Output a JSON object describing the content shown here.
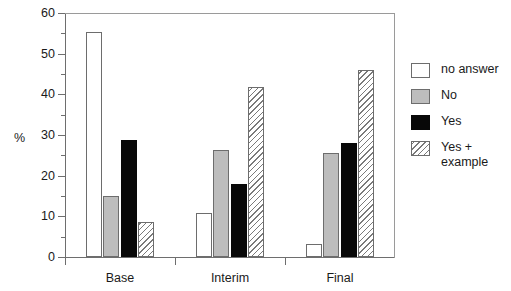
{
  "chart_data": {
    "type": "bar",
    "title": "",
    "xlabel": "",
    "ylabel": "%",
    "ylim": [
      0,
      60
    ],
    "ytick_labels": [
      "0",
      "10",
      "20",
      "30",
      "40",
      "50",
      "60"
    ],
    "ytick_values": [
      0,
      10,
      20,
      30,
      40,
      50,
      60
    ],
    "yminor_values": [
      5,
      15,
      25,
      35,
      45,
      55
    ],
    "grid": false,
    "legend_position": "right",
    "categories": [
      "Base",
      "Interim",
      "Final"
    ],
    "series": [
      {
        "name": "no answer",
        "fill": "white",
        "values": [
          55.4,
          10.8,
          3.2
        ]
      },
      {
        "name": "No",
        "fill": "gray",
        "values": [
          15.0,
          26.2,
          25.5
        ]
      },
      {
        "name": "Yes",
        "fill": "black",
        "values": [
          28.7,
          17.9,
          28.0
        ]
      },
      {
        "name": "Yes +\nexample",
        "fill": "hatched",
        "values": [
          8.6,
          41.7,
          46.0
        ]
      }
    ]
  },
  "legend": {
    "items": [
      {
        "label": "no answer",
        "fill": "white"
      },
      {
        "label": "No",
        "fill": "gray"
      },
      {
        "label": "Yes",
        "fill": "black"
      },
      {
        "label_line1": "Yes +",
        "label_line2": "example",
        "fill": "hatched"
      }
    ]
  },
  "colors": {
    "white_fill": "#ffffff",
    "gray_fill": "#bdbdbd",
    "black_fill": "#080808",
    "hatch_line": "#7a7a7a",
    "axis": "#6e6e6e",
    "text": "#1a1a1a"
  }
}
